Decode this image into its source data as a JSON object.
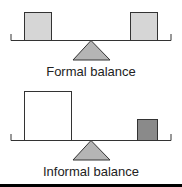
{
  "diagrams": [
    {
      "caption": "Formal balance",
      "left_weight": {
        "fill": "#d6d6d6",
        "size": "medium"
      },
      "right_weight": {
        "fill": "#d6d6d6",
        "size": "medium"
      }
    },
    {
      "caption": "Informal balance",
      "left_weight": {
        "fill": "#ffffff",
        "size": "large"
      },
      "right_weight": {
        "fill": "#8a8a8a",
        "size": "small"
      }
    }
  ],
  "colors": {
    "stroke": "#333333",
    "fulcrum": "#b5b5b5",
    "bottom_rule": "#000000"
  }
}
